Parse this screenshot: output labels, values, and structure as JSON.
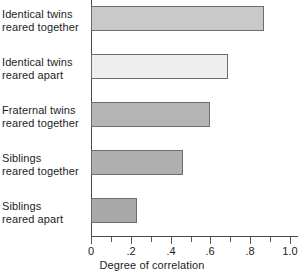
{
  "chart_data": {
    "type": "bar",
    "orientation": "horizontal",
    "title": "",
    "xlabel": "Degree of correlation",
    "ylabel": "",
    "xlim": [
      0,
      1.0
    ],
    "grid": false,
    "legend": null,
    "tick_labels": [
      "0",
      ".2",
      ".4",
      ".6",
      ".8",
      "1.0"
    ],
    "tick_values": [
      0,
      0.2,
      0.4,
      0.6,
      0.8,
      1.0
    ],
    "minor_tick_step": 0.1,
    "categories": [
      "Identical twins reared together",
      "Identical twins reared apart",
      "Fraternal twins reared together",
      "Siblings reared together",
      "Siblings reared apart"
    ],
    "category_lines": [
      [
        "Identical twins",
        "reared together"
      ],
      [
        "Identical twins",
        "reared apart"
      ],
      [
        "Fraternal twins",
        "reared together"
      ],
      [
        "Siblings",
        "reared together"
      ],
      [
        "Siblings",
        "reared apart"
      ]
    ],
    "values": [
      0.87,
      0.69,
      0.6,
      0.46,
      0.23
    ],
    "bar_colors": [
      "#c9c9c9",
      "#eeeeee",
      "#b5b5b5",
      "#b0b0b0",
      "#a9a9a9"
    ],
    "bar_border_color": "#6d6d6d",
    "axis_color": "#4a4a4a",
    "text_color": "#1d1d1d"
  }
}
